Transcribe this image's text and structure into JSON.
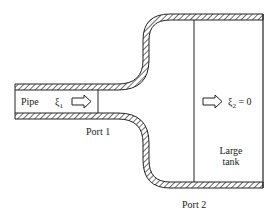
{
  "diagram": {
    "labels": {
      "pipe": "Pipe",
      "xi1": "ξ",
      "xi1_sub": "1",
      "xi2": "ξ",
      "xi2_sub": "2",
      "xi2_eq": " = 0",
      "port1": "Port 1",
      "port2": "Port 2",
      "tank_line1": "Large",
      "tank_line2": "tank"
    },
    "colors": {
      "stroke": "#222222",
      "background": "#ffffff"
    }
  }
}
